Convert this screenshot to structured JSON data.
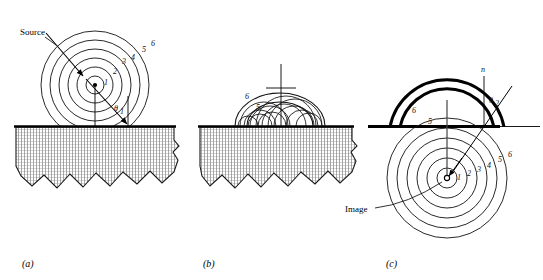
{
  "figure": {
    "background": "#ffffff",
    "ink": "#000000",
    "hatch_color": "#6f6f6f",
    "panels": [
      {
        "id": "a",
        "caption": "(a)",
        "labels": {
          "source": "Source",
          "angle": "θ",
          "angle_sub": "1"
        },
        "wavefront_numbers": [
          "1",
          "2",
          "3",
          "4",
          "5",
          "6"
        ],
        "description": "Spherical wavefronts 1-6 expanding from a point source above a reflecting surface; incident ray strikes the surface at angle theta-1."
      },
      {
        "id": "b",
        "caption": "(b)",
        "labels": {},
        "wavelet_numbers": [
          "5",
          "6"
        ],
        "description": "Huygens wavelets emitted from points on the reflecting surface, their envelope forming the reflected wavefront."
      },
      {
        "id": "c",
        "caption": "(c)",
        "labels": {
          "image": "Image",
          "normal": "n",
          "angle": "θ",
          "angle_sub": "2"
        },
        "wavefront_numbers": [
          "1",
          "2",
          "3",
          "4",
          "5",
          "6"
        ],
        "reflected_arc_numbers": [
          "5",
          "6"
        ],
        "description": "Reflected wavefronts 5 and 6 appear to originate from a virtual image point below the surface; circles 1-6 centered on the image."
      }
    ]
  }
}
